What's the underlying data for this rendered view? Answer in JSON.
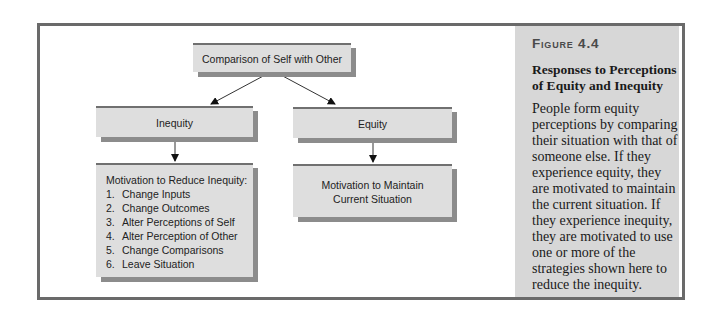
{
  "figure": {
    "label": "Figure 4.4",
    "title": "Responses to Perceptions of Equity and Inequity",
    "caption": "People form equity perceptions by comparing their situation with that of someone else. If they experience equity, they are motivated to maintain the current situation. If they experience inequity, they are motivated to use one or more of the strategies shown here to reduce the inequity."
  },
  "diagram": {
    "root": {
      "label": "Comparison of Self with Other"
    },
    "left_branch": {
      "label": "Inequity",
      "outcome": {
        "heading": "Motivation to Reduce Inequity:",
        "items": [
          {
            "num": "1.",
            "text": "Change Inputs"
          },
          {
            "num": "2.",
            "text": "Change Outcomes"
          },
          {
            "num": "3.",
            "text": "Alter Perceptions of Self"
          },
          {
            "num": "4.",
            "text": "Alter Perception of Other"
          },
          {
            "num": "5.",
            "text": "Change Comparisons"
          },
          {
            "num": "6.",
            "text": "Leave Situation"
          }
        ]
      }
    },
    "right_branch": {
      "label": "Equity",
      "outcome": {
        "line1": "Motivation to Maintain",
        "line2": "Current Situation"
      }
    }
  },
  "colors": {
    "frame": "#6a6a6a",
    "side_panel": "#d7d7d7",
    "box_fill": "#dedede",
    "box_shadow": "#8c8c8c"
  }
}
